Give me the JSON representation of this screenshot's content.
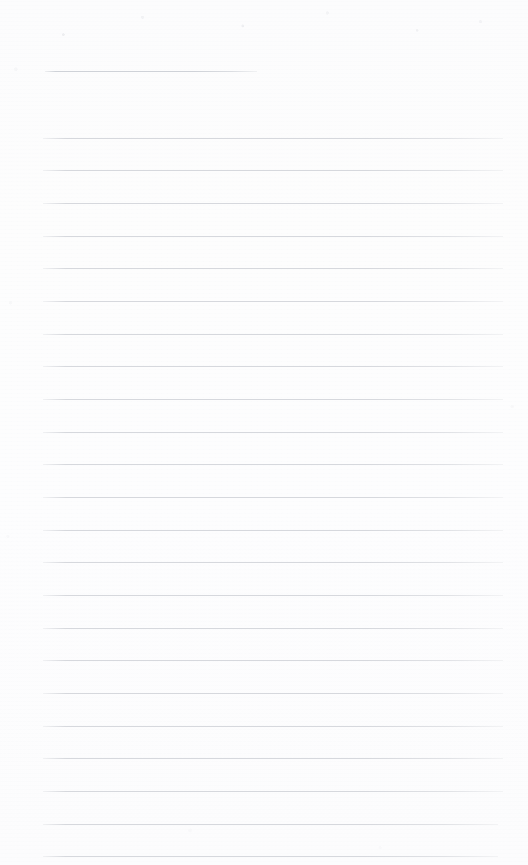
{
  "document": {
    "kind": "lined-paper-scan",
    "title": "Blank lined notepad page",
    "page_width": 528,
    "page_height": 865,
    "background_color": "#fdfdfd",
    "rule_color": "#d6d8dd",
    "rule_thickness": 1,
    "rule_count": 24,
    "text_content": "",
    "notes": "Empty ruled writing sheet; no handwriting, headings, numbers or marks present."
  },
  "rules": [
    {
      "name": "rule-1",
      "x": 45,
      "y": 71,
      "width": 212,
      "short": true
    },
    {
      "name": "rule-2",
      "x": 43,
      "y": 138,
      "width": 460,
      "short": false
    },
    {
      "name": "rule-3",
      "x": 43,
      "y": 170,
      "width": 460,
      "short": false
    },
    {
      "name": "rule-4",
      "x": 43,
      "y": 203,
      "width": 460,
      "short": false
    },
    {
      "name": "rule-5",
      "x": 43,
      "y": 236,
      "width": 460,
      "short": false
    },
    {
      "name": "rule-6",
      "x": 43,
      "y": 268,
      "width": 460,
      "short": false
    },
    {
      "name": "rule-7",
      "x": 43,
      "y": 301,
      "width": 460,
      "short": false
    },
    {
      "name": "rule-8",
      "x": 43,
      "y": 334,
      "width": 460,
      "short": false
    },
    {
      "name": "rule-9",
      "x": 43,
      "y": 366,
      "width": 460,
      "short": false
    },
    {
      "name": "rule-10",
      "x": 43,
      "y": 399,
      "width": 460,
      "short": false
    },
    {
      "name": "rule-11",
      "x": 43,
      "y": 432,
      "width": 460,
      "short": false
    },
    {
      "name": "rule-12",
      "x": 43,
      "y": 464,
      "width": 460,
      "short": false
    },
    {
      "name": "rule-13",
      "x": 43,
      "y": 497,
      "width": 460,
      "short": false
    },
    {
      "name": "rule-14",
      "x": 43,
      "y": 530,
      "width": 460,
      "short": false
    },
    {
      "name": "rule-15",
      "x": 43,
      "y": 562,
      "width": 460,
      "short": false
    },
    {
      "name": "rule-16",
      "x": 43,
      "y": 595,
      "width": 460,
      "short": false
    },
    {
      "name": "rule-17",
      "x": 43,
      "y": 628,
      "width": 460,
      "short": false
    },
    {
      "name": "rule-18",
      "x": 43,
      "y": 660,
      "width": 460,
      "short": false
    },
    {
      "name": "rule-19",
      "x": 43,
      "y": 693,
      "width": 460,
      "short": false
    },
    {
      "name": "rule-20",
      "x": 43,
      "y": 726,
      "width": 460,
      "short": false
    },
    {
      "name": "rule-21",
      "x": 43,
      "y": 758,
      "width": 460,
      "short": false
    },
    {
      "name": "rule-22",
      "x": 43,
      "y": 791,
      "width": 460,
      "short": false
    },
    {
      "name": "rule-23",
      "x": 43,
      "y": 824,
      "width": 455,
      "short": false
    },
    {
      "name": "rule-24",
      "x": 43,
      "y": 856,
      "width": 455,
      "short": false
    }
  ]
}
